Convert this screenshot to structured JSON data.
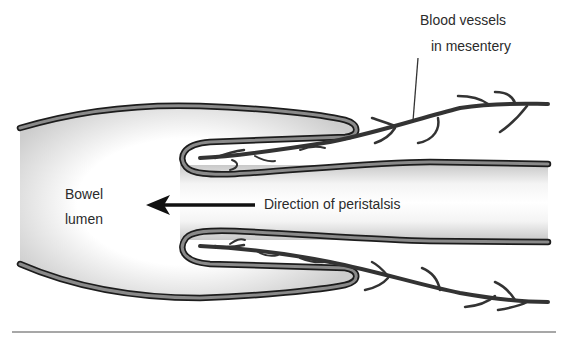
{
  "figure": {
    "labels": {
      "blood_vessels_line1": "Blood vessels",
      "blood_vessels_line2": "in mesentery",
      "bowel_lumen_line1": "Bowel",
      "bowel_lumen_line2": "lumen",
      "peristalsis": "Direction of peristalsis"
    },
    "arrow": {
      "direction": "left",
      "meaning": "peristalsis"
    },
    "colors": {
      "wall_outer": "#1e1e1e",
      "wall_fill": "#7a7a7a",
      "lumen_shade": "#d8d8d8",
      "vessel": "#3a3a3a",
      "text": "#2b2b2b",
      "rule": "#8a8a8a"
    }
  }
}
